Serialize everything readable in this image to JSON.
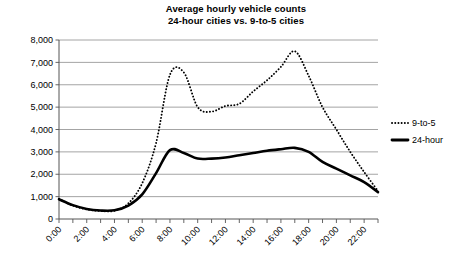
{
  "chart_data": {
    "type": "line",
    "title": "Average hourly vehicle counts",
    "subtitle": "24-hour cities vs. 9-to-5 cities",
    "xlabel": "",
    "ylabel": "",
    "ylim": [
      0,
      8000
    ],
    "yticks": [
      0,
      1000,
      2000,
      3000,
      4000,
      5000,
      6000,
      7000,
      8000
    ],
    "ytick_labels": [
      "0",
      "1,000",
      "2,000",
      "3,000",
      "4,000",
      "5,000",
      "6,000",
      "7,000",
      "8,000"
    ],
    "grid": true,
    "legend_position": "right",
    "x": [
      "0:00",
      "1:00",
      "2:00",
      "3:00",
      "4:00",
      "5:00",
      "6:00",
      "7:00",
      "8:00",
      "9:00",
      "10:00",
      "11:00",
      "12:00",
      "13:00",
      "14:00",
      "15:00",
      "16:00",
      "17:00",
      "18:00",
      "19:00",
      "20:00",
      "21:00",
      "22:00",
      "23:00"
    ],
    "xtick_labels": [
      "0:00",
      "",
      "2:00",
      "",
      "4:00",
      "",
      "6:00",
      "",
      "8:00",
      "",
      "10:00",
      "",
      "12:00",
      "",
      "14:00",
      "",
      "16:00",
      "",
      "18:00",
      "",
      "20:00",
      "",
      "22:00",
      ""
    ],
    "series": [
      {
        "name": "9-to-5",
        "style": "dotted",
        "color": "#000000",
        "values": [
          900,
          600,
          430,
          360,
          370,
          700,
          1600,
          3400,
          6450,
          6550,
          5000,
          4800,
          5050,
          5150,
          5700,
          6200,
          6800,
          7500,
          6400,
          5000,
          4000,
          3000,
          2100,
          1250
        ]
      },
      {
        "name": "24-hour",
        "style": "solid",
        "color": "#000000",
        "values": [
          880,
          620,
          450,
          380,
          390,
          600,
          1100,
          2050,
          3080,
          2950,
          2700,
          2700,
          2750,
          2850,
          2950,
          3050,
          3120,
          3180,
          3000,
          2550,
          2250,
          1950,
          1650,
          1200
        ]
      }
    ]
  },
  "legend": {
    "items": [
      {
        "label": "9-to-5",
        "marker": "dotted-line-marker"
      },
      {
        "label": "24-hour",
        "marker": "solid-line-marker"
      }
    ]
  }
}
